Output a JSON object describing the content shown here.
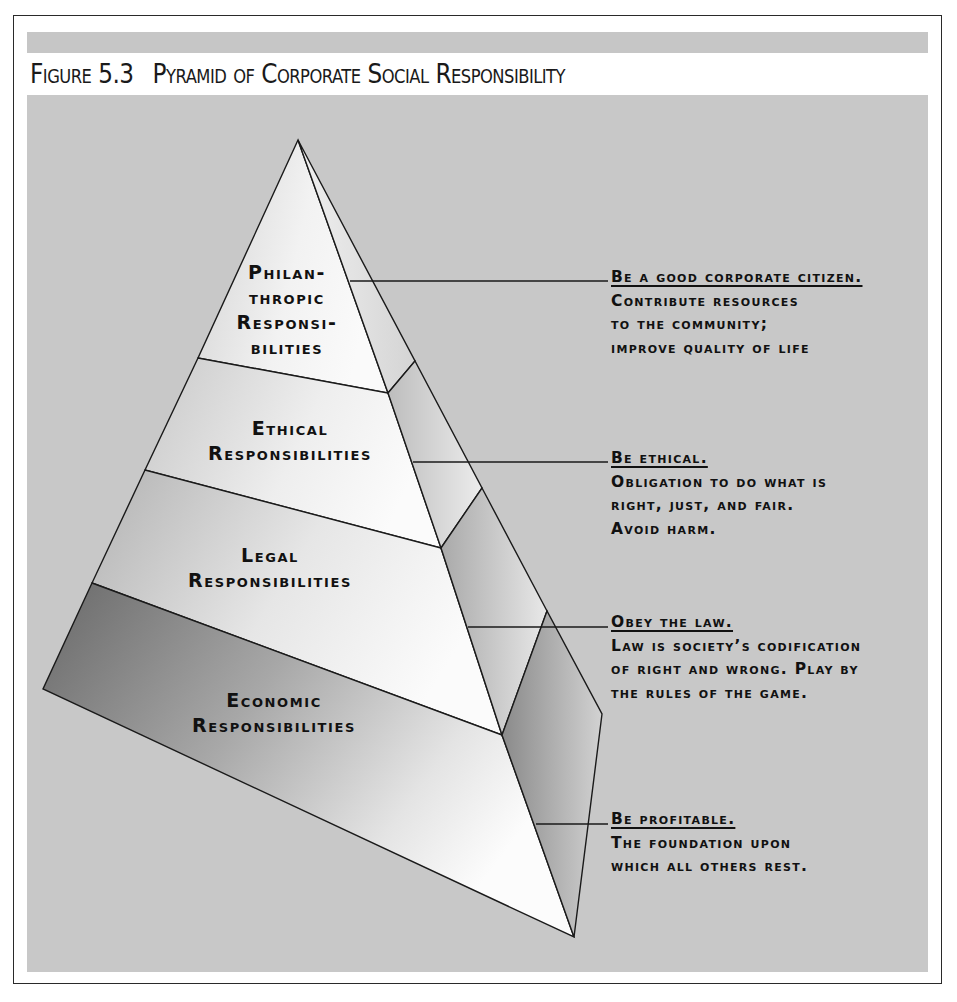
{
  "figure": {
    "number": "Figure 5.3",
    "title": "Pyramid of Corporate Social Responsibility"
  },
  "colors": {
    "frame_border": "#2a2a2a",
    "band_gray": "#c6c6c6",
    "content_bg": "#c8c8c8",
    "economic_dark": "#6e6e6e",
    "face_light": "#f4f4f4",
    "line": "#1a1a1a"
  },
  "pyramid": {
    "levels": [
      {
        "id": "philanthropic",
        "label_lines": [
          "Philan-",
          "thropic",
          "Responsi-",
          "bilities"
        ],
        "note_heading": "Be a good corporate citizen.",
        "note_lines": [
          "Contribute resources",
          "to the community;",
          "improve quality of life"
        ]
      },
      {
        "id": "ethical",
        "label_lines": [
          "Ethical",
          "Responsibilities"
        ],
        "note_heading": "Be ethical.",
        "note_lines": [
          "Obligation to do what is",
          "right, just, and fair.",
          "Avoid harm."
        ]
      },
      {
        "id": "legal",
        "label_lines": [
          "Legal",
          "Responsibilities"
        ],
        "note_heading": "Obey the law.",
        "note_lines": [
          "Law is society’s codification",
          "of right and wrong. Play by",
          "the rules of the game."
        ]
      },
      {
        "id": "economic",
        "label_lines": [
          "Economic",
          "Responsibilities"
        ],
        "note_heading": "Be profitable.",
        "note_lines": [
          "The foundation upon",
          "which all others rest."
        ]
      }
    ]
  }
}
